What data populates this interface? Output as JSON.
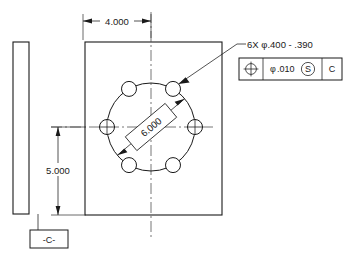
{
  "drawing": {
    "type": "mechanical-engineering-drawing",
    "title": "Bolt circle plate with position tolerance",
    "views": {
      "side_view": {
        "name": "side-edge-view",
        "shape": "thin-rectangle"
      },
      "front_view": {
        "name": "front-plate-view",
        "shape": "rectangle-with-bolt-circle"
      }
    },
    "dimensions": [
      {
        "id": "width",
        "value": "4.000",
        "orientation": "horizontal",
        "location": "top"
      },
      {
        "id": "height",
        "value": "5.000",
        "orientation": "vertical",
        "location": "left"
      },
      {
        "id": "bolt_circle",
        "value": "6.000",
        "orientation": "diagonal",
        "location": "center"
      }
    ],
    "hole_note": {
      "quantity": "6X",
      "diameter_symbol": "φ",
      "upper_limit": ".400",
      "separator": "-",
      "lower_limit": ".390",
      "full_text": "6X φ.400 - .390"
    },
    "feature_control_frame": {
      "symbol_name": "position-symbol",
      "tolerance_symbol": "φ",
      "tolerance_value": ".010",
      "material_modifier": "S",
      "datum_reference": "C"
    },
    "datum_feature": {
      "label": "-C-",
      "attached_to": "side-view-bottom"
    },
    "hole_count": 6,
    "hole_angles_deg": [
      0,
      60,
      120,
      180,
      240,
      300
    ],
    "colors": {
      "line": "#1a1a1a",
      "thin_line": "#3a3a3a",
      "centerline": "#4a4a4a",
      "background": "#ffffff"
    }
  }
}
